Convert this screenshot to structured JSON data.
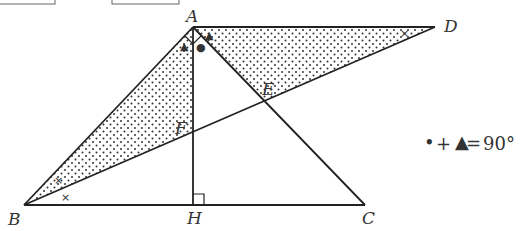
{
  "points": {
    "A": {
      "label": "A",
      "x": 193,
      "y": 27
    },
    "B": {
      "label": "B",
      "x": 24,
      "y": 205
    },
    "C": {
      "label": "C",
      "x": 365,
      "y": 205
    },
    "D": {
      "label": "D",
      "x": 435,
      "y": 27
    },
    "E": {
      "label": "E",
      "x": 265,
      "y": 101
    },
    "F": {
      "label": "F",
      "x": 193,
      "y": 131
    },
    "H": {
      "label": "H",
      "x": 193,
      "y": 205
    }
  },
  "segments": [
    "AB",
    "BC",
    "AC",
    "AD",
    "BD",
    "AH"
  ],
  "shaded_regions": [
    "triangle ABF",
    "triangle ADE"
  ],
  "angle_marks": {
    "right_angle_at": [
      "A",
      "H"
    ],
    "triangle_marks": [
      "angle BAH",
      "angle CAD"
    ],
    "dot_marks": [
      "angle HAC"
    ],
    "cross_marks": [
      "angle ABD",
      "angle DBC",
      "angle ADB"
    ]
  },
  "formula": {
    "text_dot": "•",
    "text_plus": "+",
    "text_triangle": "▲",
    "text_equals": "=",
    "text_value": "90°"
  },
  "marks": {
    "triangle": "▲",
    "dot": "●",
    "cross": "×"
  }
}
